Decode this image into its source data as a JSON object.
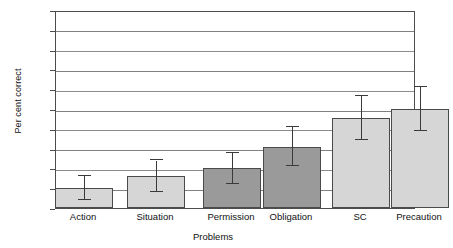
{
  "chart_data": {
    "type": "bar",
    "title": "",
    "xlabel": "Problems",
    "ylabel": "Per cent correct",
    "categories": [
      "Action",
      "Situation",
      "Permission",
      "Obligation",
      "SC",
      "Precaution"
    ],
    "values": [
      10,
      16,
      20,
      31,
      45.5,
      50
    ],
    "errors_upper": [
      6,
      8,
      8,
      10,
      11,
      11
    ],
    "errors_lower": [
      6,
      8,
      8,
      10,
      11,
      11
    ],
    "series": [
      {
        "name": "Per cent correct",
        "values": [
          10,
          16,
          20,
          31,
          45.5,
          50
        ]
      }
    ],
    "bar_fills": [
      "light",
      "light",
      "dark",
      "dark",
      "light",
      "light"
    ],
    "ylim": [
      0,
      100
    ],
    "yticks": [
      0,
      10,
      20,
      30,
      40,
      50,
      60,
      70,
      80,
      90,
      100
    ],
    "ytick_labels": [
      "0",
      "10",
      "20",
      "30",
      "40",
      "50",
      "60",
      "70",
      "80",
      "90",
      "100"
    ],
    "grid": true,
    "legend": "none",
    "colors": {
      "bar_light": "#d6d6d6",
      "bar_dark": "#9a9a9a",
      "bar_edge": "#4a4a4a",
      "gridline": "#808080",
      "frame": "#4d4d4d",
      "error_bar": "#3a3a3a",
      "text": "#111111",
      "background": "#ffffff"
    }
  }
}
